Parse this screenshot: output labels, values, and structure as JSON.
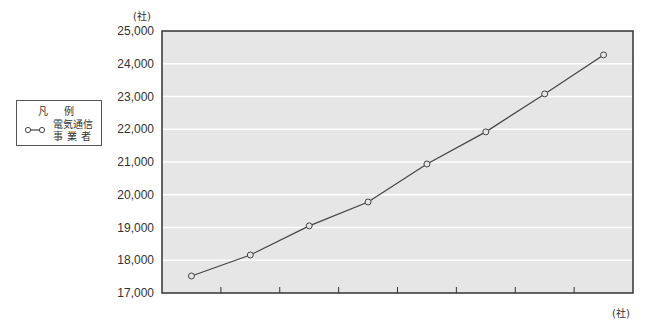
{
  "chart_data": {
    "type": "line",
    "title": "",
    "xlabel": "(社)",
    "ylabel": "(社)",
    "ylim": [
      17000,
      25000
    ],
    "yticks": [
      "17,000",
      "18,000",
      "19,000",
      "20,000",
      "21,000",
      "22,000",
      "23,000",
      "24,000",
      "25,000"
    ],
    "grid": true,
    "legend_position": "left",
    "categories": [
      "",
      "",
      "",
      "",
      "",
      "",
      "",
      ""
    ],
    "series": [
      {
        "name": "電気通信事業者",
        "marker": "open-circle",
        "color": "#444444",
        "values": [
          17520,
          18160,
          19050,
          19780,
          20940,
          21920,
          23080,
          24270
        ]
      }
    ]
  },
  "labels": {
    "unit_top": "(社)",
    "unit_bottom": "(社)",
    "legend_title": "凡 例",
    "legend_line1": "電気通信",
    "legend_line2": "事業者"
  },
  "colors": {
    "plot_bg": "#e6e6e6",
    "gridline": "#ffffff",
    "axis": "#333333",
    "line": "#444444"
  }
}
